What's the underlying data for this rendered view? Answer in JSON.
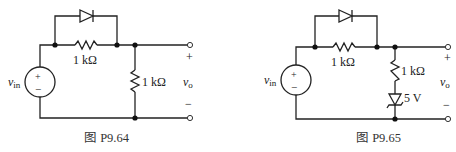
{
  "figures": [
    {
      "caption": "图 P9.64",
      "source": {
        "label_main": "v",
        "label_sub": "in",
        "plus": "+",
        "minus": "−"
      },
      "series_resistor": {
        "label": "1 kΩ"
      },
      "shunt_resistor": {
        "label": "1 kΩ"
      },
      "diode": {
        "orientation": "anode-left"
      },
      "output": {
        "label_main": "v",
        "label_sub": "o",
        "plus": "+",
        "minus": "−"
      }
    },
    {
      "caption": "图 P9.65",
      "source": {
        "label_main": "v",
        "label_sub": "in",
        "plus": "+",
        "minus": "−"
      },
      "series_resistor": {
        "label": "1 kΩ"
      },
      "shunt_resistor": {
        "label": "1 kΩ"
      },
      "zener": {
        "label": "5 V"
      },
      "diode": {
        "orientation": "anode-left"
      },
      "output": {
        "label_main": "v",
        "label_sub": "o",
        "plus": "+",
        "minus": "−"
      }
    }
  ]
}
